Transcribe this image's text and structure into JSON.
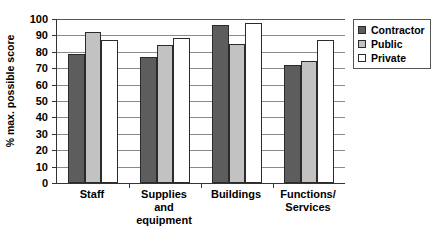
{
  "chart_data": {
    "type": "bar",
    "title": "",
    "xlabel": "",
    "ylabel": "% max. possible score",
    "ylim": [
      0,
      100
    ],
    "ytick_step": 10,
    "yticks": [
      100,
      90,
      80,
      70,
      60,
      50,
      40,
      30,
      20,
      10,
      0
    ],
    "grid": true,
    "grid_axis": "y",
    "legend_position": "right-top",
    "categories": [
      "Staff",
      "Supplies\nand\nequipment",
      "Buildings",
      "Functions/\nServices"
    ],
    "series": [
      {
        "name": "Contractor",
        "color": "#5d5d5d",
        "values": [
          78.5,
          77.0,
          96.5,
          72.0
        ]
      },
      {
        "name": "Public",
        "color": "#c2c2c2",
        "values": [
          92.0,
          84.0,
          85.0,
          74.5
        ]
      },
      {
        "name": "Private",
        "color": "#ffffff",
        "values": [
          87.5,
          88.5,
          97.5,
          87.0
        ]
      }
    ]
  },
  "legend": {
    "items": [
      {
        "label": "Contractor"
      },
      {
        "label": "Public"
      },
      {
        "label": "Private"
      }
    ]
  }
}
